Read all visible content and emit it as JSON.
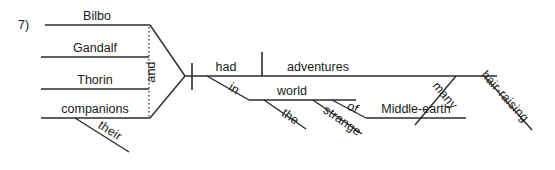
{
  "canvas": {
    "width": 555,
    "height": 170,
    "background": "#ffffff",
    "ink_color": "#2b2b2b",
    "text_color": "#1a1a1a"
  },
  "exercise": {
    "number_label": "7)"
  },
  "diagram": {
    "type": "reed-kellogg-sentence-diagram",
    "sentence": "Bilbo, Gandalf, Thorin and their companions had many hair-raising adventures in the strange world of Middle-earth.",
    "compound_subject": {
      "conjunction": "and",
      "items": [
        {
          "id": "subject-bilbo",
          "text": "Bilbo"
        },
        {
          "id": "subject-gandalf",
          "text": "Gandalf"
        },
        {
          "id": "subject-thorin",
          "text": "Thorin"
        },
        {
          "id": "subject-companions",
          "text": "companions"
        }
      ],
      "modifiers": [
        {
          "id": "modifier-their",
          "text": "their",
          "attaches_to": "subject-companions"
        }
      ]
    },
    "predicate": {
      "verb": {
        "id": "verb-had",
        "text": "had"
      },
      "direct_object": {
        "id": "object-adventures",
        "text": "adventures"
      },
      "object_modifiers": [
        {
          "id": "modifier-many",
          "text": "many"
        },
        {
          "id": "modifier-hair-raising",
          "text": "hair-raising"
        }
      ]
    },
    "prepositional_phrases": [
      {
        "id": "prep-in",
        "preposition": "in",
        "object": {
          "id": "object-world",
          "text": "world"
        },
        "object_modifiers": [
          {
            "id": "modifier-the",
            "text": "the"
          },
          {
            "id": "modifier-strange",
            "text": "strange"
          }
        ]
      },
      {
        "id": "prep-of",
        "preposition": "of",
        "object": {
          "id": "object-middle-earth",
          "text": "Middle-earth"
        },
        "object_modifiers": []
      }
    ]
  },
  "geometry": {
    "number_pos": {
      "x": 18,
      "y": 29
    },
    "subject_lines": [
      {
        "id": "subject-bilbo",
        "x1": 45,
        "y1": 25,
        "x2": 150,
        "y2": 25,
        "label_x": 97,
        "label_y": 20
      },
      {
        "id": "subject-gandalf",
        "x1": 41,
        "y1": 57,
        "x2": 149,
        "y2": 57,
        "label_x": 95,
        "label_y": 52
      },
      {
        "id": "subject-thorin",
        "x1": 41,
        "y1": 89,
        "x2": 149,
        "y2": 89,
        "label_x": 95,
        "label_y": 84
      },
      {
        "id": "subject-companions",
        "x1": 41,
        "y1": 118,
        "x2": 150,
        "y2": 118,
        "label_x": 95,
        "label_y": 113
      }
    ],
    "brace": [
      {
        "id": "brace-top",
        "x1": 150,
        "y1": 25,
        "x2": 185,
        "y2": 76
      },
      {
        "id": "brace-bottom",
        "x1": 150,
        "y1": 118,
        "x2": 185,
        "y2": 76
      }
    ],
    "conjunction_line": {
      "x1": 149,
      "y1": 27,
      "x2": 149,
      "y2": 117
    },
    "conjunction_label": {
      "x": 155,
      "y": 72,
      "rotate": -90
    },
    "their_line": {
      "x1": 75,
      "y1": 118,
      "x2": 129,
      "y2": 152,
      "label_x": 108,
      "label_y": 134,
      "rotate": 32
    },
    "baseline": {
      "x1": 185,
      "y1": 76,
      "x2": 497,
      "y2": 76
    },
    "subject_verb_bar": {
      "x": 192,
      "y1": 63,
      "y2": 90
    },
    "verb_object_bar": {
      "x": 262,
      "y1": 52,
      "y2": 76
    },
    "verb_label": {
      "x": 226,
      "y": 71
    },
    "object_label": {
      "x": 318,
      "y": 71
    },
    "in_line": {
      "x1": 207,
      "y1": 76,
      "x2": 249,
      "y2": 100,
      "label_x": 232,
      "label_y": 92,
      "rotate": 32
    },
    "world_line": {
      "x1": 249,
      "y1": 100,
      "x2": 356,
      "y2": 100,
      "label_x": 292,
      "label_y": 95
    },
    "the_line": {
      "x1": 264,
      "y1": 100,
      "x2": 306,
      "y2": 129,
      "label_x": 288,
      "label_y": 120,
      "rotate": 35
    },
    "strange_line": {
      "x1": 313,
      "y1": 100,
      "x2": 362,
      "y2": 134,
      "label_x": 340,
      "label_y": 124,
      "rotate": 35
    },
    "of_line": {
      "x1": 332,
      "y1": 100,
      "x2": 366,
      "y2": 118,
      "label_x": 351,
      "label_y": 111,
      "rotate": 28
    },
    "middle_earth_line": {
      "x1": 366,
      "y1": 118,
      "x2": 466,
      "y2": 118,
      "label_x": 416,
      "label_y": 113
    },
    "many_line": {
      "x1": 456,
      "y1": 76,
      "x2": 415,
      "y2": 125,
      "label_x": 442,
      "label_y": 98,
      "rotate": 50
    },
    "hair_raising_line": {
      "x1": 484,
      "y1": 76,
      "x2": 532,
      "y2": 130,
      "label_x": 502,
      "label_y": 99,
      "rotate": 48
    }
  }
}
